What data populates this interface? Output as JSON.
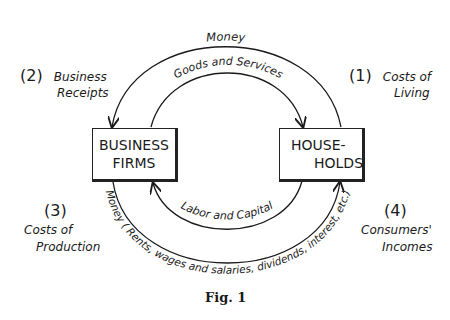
{
  "diagram": {
    "nodes": {
      "business_firms": {
        "line1": "BUSINESS",
        "line2": "FIRMS"
      },
      "households": {
        "line1": "HOUSE-",
        "line2": "HOLDS"
      }
    },
    "flows": {
      "top_outer": "Money",
      "top_inner": "Goods and Services",
      "bottom_inner": "Labor and Capital",
      "bottom_outer": "Money ( Rents, wages and salaries, dividends, interest, etc.)"
    },
    "labels": {
      "l1": {
        "num": "(1)",
        "line1": "Costs of",
        "line2": "Living"
      },
      "l2": {
        "num": "(2)",
        "line1": "Business",
        "line2": "Receipts"
      },
      "l3": {
        "num": "(3)",
        "line1": "Costs of",
        "line2": "Production"
      },
      "l4": {
        "num": "(4)",
        "line1": "Consumers'",
        "line2": "Incomes"
      }
    },
    "caption": "Fig. 1",
    "stroke_color": "#1a1a1a"
  }
}
